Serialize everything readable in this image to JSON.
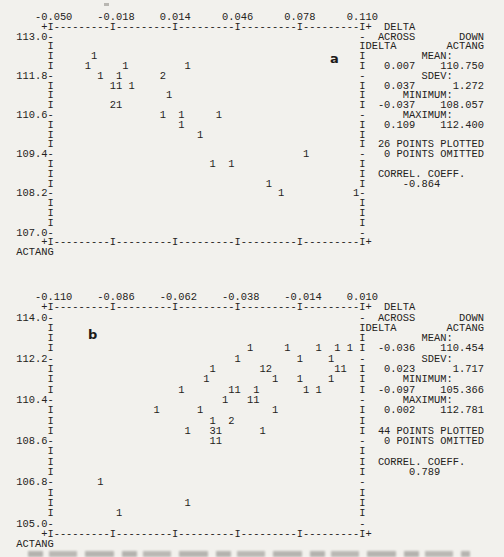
{
  "page": {
    "background": "#f2f1ed",
    "ink": "#242220"
  },
  "figure": {
    "panels": [
      {
        "panel_label": "a",
        "corner_label": "ACTANG",
        "x_axis_line": "    -0.050    -0.018    0.014     0.046     0.078     0.110",
        "x_tick_labels": [
          "-0.050",
          "-0.018",
          "0.014",
          "0.046",
          "0.078",
          "0.110"
        ],
        "y_tick_labels": [
          "113.0",
          "111.8",
          "110.6",
          "109.4",
          "108.2",
          "107.0"
        ],
        "y_rows": {
          "2": "113.0",
          "6": "111.8",
          "10": "110.6",
          "14": "109.4",
          "18": "108.2",
          "22": "107.0"
        },
        "right_column": {
          "1": "  DELTA",
          "2": "  ACROSS       DOWN",
          "3": "DELTA        ACTANG",
          "4": "         MEAN:",
          "5": "   0.007    110.750",
          "6": "         SDEV:",
          "7": "   0.037      1.272",
          "8": "      MINIMUM:",
          "9": "  -0.037    108.057",
          "10": "      MAXIMUM:",
          "11": "   0.109    112.400",
          "13": "  26 POINTS PLOTTED",
          "14": "   0 POINTS OMITTED",
          "16": "  CORREL. COEFF.",
          "17": "      -0.864"
        },
        "glyphs": [
          [
            4,
            13,
            "1"
          ],
          [
            5,
            12,
            "1"
          ],
          [
            5,
            18,
            "1"
          ],
          [
            5,
            28,
            "1"
          ],
          [
            6,
            14,
            "1"
          ],
          [
            6,
            17,
            "1"
          ],
          [
            6,
            24,
            "2"
          ],
          [
            7,
            16,
            "1"
          ],
          [
            7,
            17,
            "1"
          ],
          [
            7,
            19,
            "1"
          ],
          [
            8,
            25,
            "1"
          ],
          [
            9,
            16,
            "2"
          ],
          [
            9,
            17,
            "1"
          ],
          [
            10,
            24,
            "1"
          ],
          [
            10,
            27,
            "1"
          ],
          [
            10,
            33,
            "1"
          ],
          [
            11,
            27,
            "1"
          ],
          [
            12,
            30,
            "1"
          ],
          [
            14,
            47,
            "1"
          ],
          [
            15,
            32,
            "1"
          ],
          [
            15,
            35,
            "1"
          ],
          [
            17,
            41,
            "1"
          ],
          [
            18,
            43,
            "1"
          ],
          [
            18,
            55,
            "1"
          ]
        ]
      },
      {
        "panel_label": "b",
        "corner_label": "ACTANG",
        "x_axis_line": "    -0.110    -0.086    -0.062    -0.038    -0.014    0.010",
        "x_tick_labels": [
          "-0.110",
          "-0.086",
          "-0.062",
          "-0.038",
          "-0.014",
          "0.010"
        ],
        "y_tick_labels": [
          "114.0",
          "112.2",
          "110.4",
          "108.6",
          "106.8",
          "105.0"
        ],
        "y_rows": {
          "2": "114.0",
          "6": "112.2",
          "10": "110.4",
          "14": "108.6",
          "18": "106.8",
          "22": "105.0"
        },
        "right_column": {
          "1": "  DELTA",
          "2": "  ACROSS       DOWN",
          "3": "DELTA        ACTANG",
          "4": "         MEAN:",
          "5": "  -0.036    110.454",
          "6": "         SDEV:",
          "7": "   0.023      1.717",
          "8": "      MINIMUM:",
          "9": "  -0.097    105.366",
          "10": "      MAXIMUM:",
          "11": "   0.002    112.781",
          "13": "  44 POINTS PLOTTED",
          "14": "   0 POINTS OMITTED",
          "16": "  CORREL. COEFF.",
          "17": "       0.789"
        },
        "glyphs": [
          [
            5,
            38,
            "1"
          ],
          [
            5,
            44,
            "1"
          ],
          [
            5,
            49,
            "1"
          ],
          [
            5,
            52,
            "1"
          ],
          [
            5,
            54,
            "1"
          ],
          [
            6,
            36,
            "1"
          ],
          [
            6,
            46,
            "1"
          ],
          [
            6,
            51,
            "1"
          ],
          [
            7,
            32,
            "1"
          ],
          [
            7,
            40,
            "1"
          ],
          [
            7,
            41,
            "2"
          ],
          [
            7,
            52,
            "1"
          ],
          [
            7,
            53,
            "1"
          ],
          [
            8,
            31,
            "1"
          ],
          [
            8,
            42,
            "1"
          ],
          [
            8,
            46,
            "1"
          ],
          [
            8,
            51,
            "1"
          ],
          [
            9,
            27,
            "1"
          ],
          [
            9,
            35,
            "1"
          ],
          [
            9,
            36,
            "1"
          ],
          [
            9,
            39,
            "1"
          ],
          [
            9,
            47,
            "1"
          ],
          [
            9,
            49,
            "1"
          ],
          [
            10,
            34,
            "1"
          ],
          [
            10,
            38,
            "1"
          ],
          [
            10,
            39,
            "1"
          ],
          [
            11,
            23,
            "1"
          ],
          [
            11,
            30,
            "1"
          ],
          [
            11,
            42,
            "1"
          ],
          [
            12,
            32,
            "1"
          ],
          [
            12,
            35,
            "2"
          ],
          [
            13,
            28,
            "1"
          ],
          [
            13,
            32,
            "3"
          ],
          [
            13,
            33,
            "1"
          ],
          [
            13,
            40,
            "1"
          ],
          [
            14,
            32,
            "1"
          ],
          [
            14,
            33,
            "1"
          ],
          [
            18,
            14,
            "1"
          ],
          [
            20,
            28,
            "1"
          ],
          [
            21,
            17,
            "1"
          ]
        ]
      }
    ]
  },
  "chart_data": [
    {
      "type": "scatter",
      "panel": "a",
      "x_variable": "DELTA",
      "y_variable": "ACTANG",
      "x_ticks": [
        -0.05,
        -0.018,
        0.014,
        0.046,
        0.078,
        0.11
      ],
      "y_ticks": [
        113.0,
        111.8,
        110.6,
        109.4,
        108.2,
        107.0
      ],
      "xlim": [
        -0.05,
        0.11
      ],
      "ylim": [
        107.0,
        113.0
      ],
      "points_xy_count": [
        [
          -0.0276,
          112.4,
          1
        ],
        [
          -0.0308,
          112.1,
          1
        ],
        [
          -0.0116,
          112.1,
          1
        ],
        [
          0.0204,
          112.1,
          1
        ],
        [
          -0.0244,
          111.8,
          1
        ],
        [
          -0.0148,
          111.8,
          1
        ],
        [
          0.0076,
          111.8,
          2
        ],
        [
          -0.018,
          111.5,
          1
        ],
        [
          -0.0148,
          111.5,
          1
        ],
        [
          -0.0084,
          111.5,
          1
        ],
        [
          0.0108,
          111.2,
          1
        ],
        [
          -0.018,
          110.9,
          2
        ],
        [
          -0.0148,
          110.9,
          1
        ],
        [
          0.0076,
          110.6,
          1
        ],
        [
          0.0172,
          110.6,
          1
        ],
        [
          0.0364,
          110.6,
          1
        ],
        [
          0.0172,
          110.3,
          1
        ],
        [
          0.0268,
          110.0,
          1
        ],
        [
          0.0812,
          109.4,
          1
        ],
        [
          0.0332,
          109.1,
          1
        ],
        [
          0.0428,
          109.1,
          1
        ],
        [
          0.062,
          108.5,
          1
        ],
        [
          0.0684,
          108.2,
          1
        ],
        [
          0.1068,
          108.2,
          1
        ]
      ],
      "stats": {
        "mean": {
          "delta": 0.007,
          "actang": 110.75
        },
        "sdev": {
          "delta": 0.037,
          "actang": 1.272
        },
        "minimum": {
          "delta": -0.037,
          "actang": 108.057
        },
        "maximum": {
          "delta": 0.109,
          "actang": 112.4
        },
        "points_plotted": 26,
        "points_omitted": 0,
        "correl_coeff": -0.864
      }
    },
    {
      "type": "scatter",
      "panel": "b",
      "x_variable": "DELTA",
      "y_variable": "ACTANG",
      "x_ticks": [
        -0.11,
        -0.086,
        -0.062,
        -0.038,
        -0.014,
        0.01
      ],
      "y_ticks": [
        114.0,
        112.2,
        110.4,
        108.6,
        106.8,
        105.0
      ],
      "xlim": [
        -0.11,
        0.01
      ],
      "ylim": [
        105.0,
        114.0
      ],
      "points_xy_count": [
        [
          -0.0332,
          112.65,
          1
        ],
        [
          -0.0188,
          112.65,
          1
        ],
        [
          -0.0068,
          112.65,
          1
        ],
        [
          0.0004,
          112.65,
          1
        ],
        [
          0.0052,
          112.65,
          1
        ],
        [
          -0.038,
          112.2,
          1
        ],
        [
          -0.014,
          112.2,
          1
        ],
        [
          -0.002,
          112.2,
          1
        ],
        [
          -0.0476,
          111.75,
          1
        ],
        [
          -0.0284,
          111.75,
          1
        ],
        [
          -0.026,
          111.75,
          2
        ],
        [
          0.0004,
          111.75,
          1
        ],
        [
          0.0028,
          111.75,
          1
        ],
        [
          -0.05,
          111.3,
          1
        ],
        [
          -0.0236,
          111.3,
          1
        ],
        [
          -0.014,
          111.3,
          1
        ],
        [
          -0.002,
          111.3,
          1
        ],
        [
          -0.0596,
          110.85,
          1
        ],
        [
          -0.0404,
          110.85,
          1
        ],
        [
          -0.038,
          110.85,
          1
        ],
        [
          -0.0308,
          110.85,
          1
        ],
        [
          -0.0116,
          110.85,
          1
        ],
        [
          -0.0068,
          110.85,
          1
        ],
        [
          -0.0428,
          110.4,
          1
        ],
        [
          -0.0332,
          110.4,
          1
        ],
        [
          -0.0308,
          110.4,
          1
        ],
        [
          -0.0692,
          109.95,
          1
        ],
        [
          -0.0524,
          109.95,
          1
        ],
        [
          -0.0236,
          109.95,
          1
        ],
        [
          -0.0476,
          109.5,
          1
        ],
        [
          -0.0404,
          109.5,
          2
        ],
        [
          -0.0572,
          109.05,
          1
        ],
        [
          -0.0476,
          109.05,
          3
        ],
        [
          -0.0452,
          109.05,
          1
        ],
        [
          -0.0284,
          109.05,
          1
        ],
        [
          -0.0476,
          108.6,
          1
        ],
        [
          -0.0452,
          108.6,
          1
        ],
        [
          -0.0908,
          106.8,
          1
        ],
        [
          -0.0572,
          105.9,
          1
        ],
        [
          -0.0836,
          105.45,
          1
        ]
      ],
      "stats": {
        "mean": {
          "delta": -0.036,
          "actang": 110.454
        },
        "sdev": {
          "delta": 0.023,
          "actang": 1.717
        },
        "minimum": {
          "delta": -0.097,
          "actang": 105.366
        },
        "maximum": {
          "delta": 0.002,
          "actang": 112.781
        },
        "points_plotted": 44,
        "points_omitted": 0,
        "correl_coeff": 0.789
      }
    }
  ]
}
